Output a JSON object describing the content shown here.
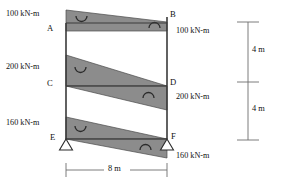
{
  "figure": {
    "type": "structural-bending-moment-diagram",
    "colors": {
      "diagram_fill": "#8c8c8c",
      "frame_line": "#3a3a3a",
      "dimension_line": "#6e6e6e",
      "text": "#111111"
    }
  },
  "nodes": [
    {
      "id": "A",
      "label": "A",
      "x": 66,
      "y": 30
    },
    {
      "id": "B",
      "label": "B",
      "x": 167,
      "y": 16
    },
    {
      "id": "C",
      "label": "C",
      "x": 66,
      "y": 86
    },
    {
      "id": "D",
      "label": "D",
      "x": 167,
      "y": 84
    },
    {
      "id": "E",
      "label": "E",
      "x": 66,
      "y": 140
    },
    {
      "id": "F",
      "label": "F",
      "x": 167,
      "y": 139
    }
  ],
  "moments": [
    {
      "id": "m-a",
      "value": "100 kN-m",
      "node": "A",
      "side": "left",
      "sense": "sagging"
    },
    {
      "id": "m-b",
      "value": "100 kN-m",
      "node": "B",
      "side": "right",
      "sense": "hogging"
    },
    {
      "id": "m-c",
      "value": "200 kN-m",
      "node": "C",
      "side": "left",
      "sense": "sagging"
    },
    {
      "id": "m-d",
      "value": "200 kN-m",
      "node": "D",
      "side": "right",
      "sense": "hogging"
    },
    {
      "id": "m-e",
      "value": "160 kN-m",
      "node": "E",
      "side": "left",
      "sense": "sagging"
    },
    {
      "id": "m-f",
      "value": "160 kN-m",
      "node": "F",
      "side": "right",
      "sense": "hogging"
    }
  ],
  "labels": {
    "moment_a": "100 kN-m",
    "moment_b": "100 kN-m",
    "moment_c": "200 kN-m",
    "moment_d": "200 kN-m",
    "moment_e": "160 kN-m",
    "moment_f": "160 kN-m",
    "node_a": "A",
    "node_b": "B",
    "node_c": "C",
    "node_d": "D",
    "node_e": "E",
    "node_f": "F"
  },
  "dimensions": {
    "span": {
      "label": "8 m",
      "orientation": "horizontal",
      "position": "bottom"
    },
    "story_upper": {
      "label": "4 m",
      "orientation": "vertical",
      "position": "right"
    },
    "story_lower": {
      "label": "4 m",
      "orientation": "vertical",
      "position": "right"
    }
  },
  "supports": [
    {
      "id": "support-e",
      "node": "E",
      "type": "pin"
    },
    {
      "id": "support-f",
      "node": "F",
      "type": "pin"
    }
  ]
}
